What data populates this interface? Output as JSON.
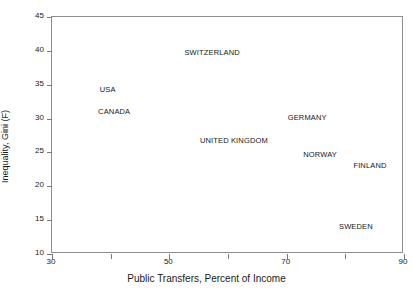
{
  "chart_data": {
    "type": "scatter",
    "title": "",
    "xlabel": "Public Transfers, Percent of Income",
    "ylabel": "Inequality, Gini (F)",
    "xlim": [
      30,
      90
    ],
    "ylim": [
      10,
      45
    ],
    "grid": false,
    "legend": "none",
    "x_ticks": [
      30,
      40,
      50,
      60,
      70,
      80,
      90
    ],
    "x_tick_labels": [
      "30",
      "",
      "50",
      "",
      "70",
      "",
      "90"
    ],
    "y_ticks": [
      10,
      15,
      20,
      25,
      30,
      35,
      40,
      45
    ],
    "y_tick_labels": [
      "10",
      "15",
      "20",
      "25",
      "30",
      "35",
      "40",
      "45"
    ],
    "point_label_style": "text-only, no marker glyphs",
    "points": [
      {
        "label": "SWITZERLAND",
        "x": 57.3,
        "y": 39.7
      },
      {
        "label": "USA",
        "x": 39.5,
        "y": 34.2
      },
      {
        "label": "CANADA",
        "x": 40.6,
        "y": 31.0
      },
      {
        "label": "GERMANY",
        "x": 73.5,
        "y": 30.1
      },
      {
        "label": "UNITED KINGDOM",
        "x": 61.0,
        "y": 26.7
      },
      {
        "label": "NORWAY",
        "x": 75.7,
        "y": 24.6
      },
      {
        "label": "FINLAND",
        "x": 84.2,
        "y": 23.0
      },
      {
        "label": "SWEDEN",
        "x": 81.8,
        "y": 14.0
      }
    ]
  },
  "colors": {
    "frame": "#8d8d8d",
    "tick": "#7a7a7a",
    "text": "#1a1a1a",
    "background": "#ffffff"
  }
}
